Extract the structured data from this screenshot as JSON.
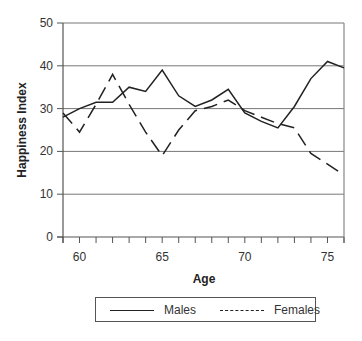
{
  "chart_data": {
    "type": "line",
    "title": "",
    "xlabel": "Age",
    "ylabel": "Happiness Index",
    "xlim": [
      59,
      76
    ],
    "ylim": [
      0,
      50
    ],
    "x_ticks": [
      60,
      65,
      70,
      75
    ],
    "y_ticks": [
      0,
      10,
      20,
      30,
      40,
      50
    ],
    "grid": "horizontal",
    "legend_position": "bottom",
    "x": [
      59,
      60,
      61,
      62,
      63,
      64,
      65,
      66,
      67,
      68,
      69,
      70,
      71,
      72,
      73,
      74,
      75,
      76
    ],
    "series": [
      {
        "name": "Males",
        "style": "solid",
        "values": [
          28,
          30,
          31.5,
          31.5,
          35,
          34,
          39,
          33,
          30.5,
          32,
          34.5,
          29,
          27,
          25.5,
          30.5,
          37,
          41,
          39.5
        ]
      },
      {
        "name": "Females",
        "style": "dashed",
        "values": [
          29,
          24.5,
          31,
          38,
          31,
          24.5,
          19,
          25,
          29.5,
          30.5,
          32,
          29.5,
          28,
          26.5,
          25.5,
          19.5,
          17,
          14.5
        ]
      }
    ]
  },
  "legend": {
    "items": [
      {
        "label": "Males"
      },
      {
        "label": "Females"
      }
    ]
  }
}
